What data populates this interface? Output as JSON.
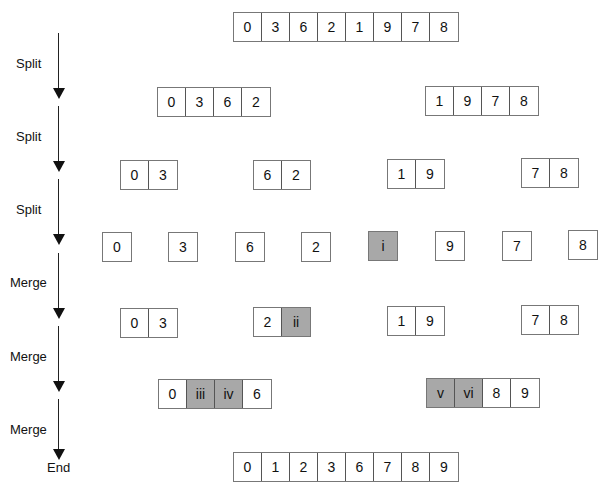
{
  "stages": [
    {
      "label": "Split"
    },
    {
      "label": "Split"
    },
    {
      "label": "Split"
    },
    {
      "label": "Merge"
    },
    {
      "label": "Merge"
    },
    {
      "label": "Merge"
    }
  ],
  "end_label": "End",
  "highlight_color": "#a8a8a8",
  "rows": {
    "r0": [
      [
        "0",
        "3",
        "6",
        "2",
        "1",
        "9",
        "7",
        "8"
      ]
    ],
    "r1": [
      [
        "0",
        "3",
        "6",
        "2"
      ],
      [
        "1",
        "9",
        "7",
        "8"
      ]
    ],
    "r2": [
      [
        "0",
        "3"
      ],
      [
        "6",
        "2"
      ],
      [
        "1",
        "9"
      ],
      [
        "7",
        "8"
      ]
    ],
    "r3": [
      [
        "0"
      ],
      [
        "3"
      ],
      [
        "6"
      ],
      [
        "2"
      ],
      [
        "i"
      ],
      [
        "9"
      ],
      [
        "7"
      ],
      [
        "8"
      ]
    ],
    "r4": [
      [
        "0",
        "3"
      ],
      [
        "2",
        "ii"
      ],
      [
        "1",
        "9"
      ],
      [
        "7",
        "8"
      ]
    ],
    "r5": [
      [
        "0",
        "iii",
        "iv",
        "6"
      ],
      [
        "v",
        "vi",
        "8",
        "9"
      ]
    ],
    "r6": [
      [
        "0",
        "1",
        "2",
        "3",
        "6",
        "7",
        "8",
        "9"
      ]
    ]
  },
  "highlighted": [
    "i",
    "ii",
    "iii",
    "iv",
    "v",
    "vi"
  ]
}
